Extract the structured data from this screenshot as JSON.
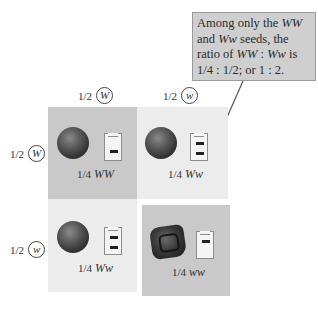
{
  "callout": {
    "line1_a": "Among only the ",
    "line1_b": "WW",
    "line2_a": "and ",
    "line2_b": "Ww",
    "line2_c": " seeds, the",
    "line3_a": "ratio of ",
    "line3_b": "WW",
    "line3_c": " : ",
    "line3_d": "Ww",
    "line3_e": " is",
    "line4": "1/4 : 1/2; or 1 : 2."
  },
  "columns": [
    {
      "fraction": "1/2",
      "allele": "W"
    },
    {
      "fraction": "1/2",
      "allele": "w"
    }
  ],
  "rows": [
    {
      "fraction": "1/2",
      "allele": "W"
    },
    {
      "fraction": "1/2",
      "allele": "w"
    }
  ],
  "cells": [
    {
      "fraction": "1/4",
      "genotype": "WW",
      "seed": "round",
      "bands": 1
    },
    {
      "fraction": "1/4",
      "genotype": "Ww",
      "seed": "round",
      "bands": 2
    },
    {
      "fraction": "1/4",
      "genotype": "Ww",
      "seed": "round",
      "bands": 2
    },
    {
      "fraction": "1/4",
      "genotype": "ww",
      "seed": "wrinkled",
      "bands": 1
    }
  ],
  "colors": {
    "dark_cell": "#c9c9c9",
    "light_cell": "#ececec",
    "callout_bg": "#cfcfcf"
  }
}
